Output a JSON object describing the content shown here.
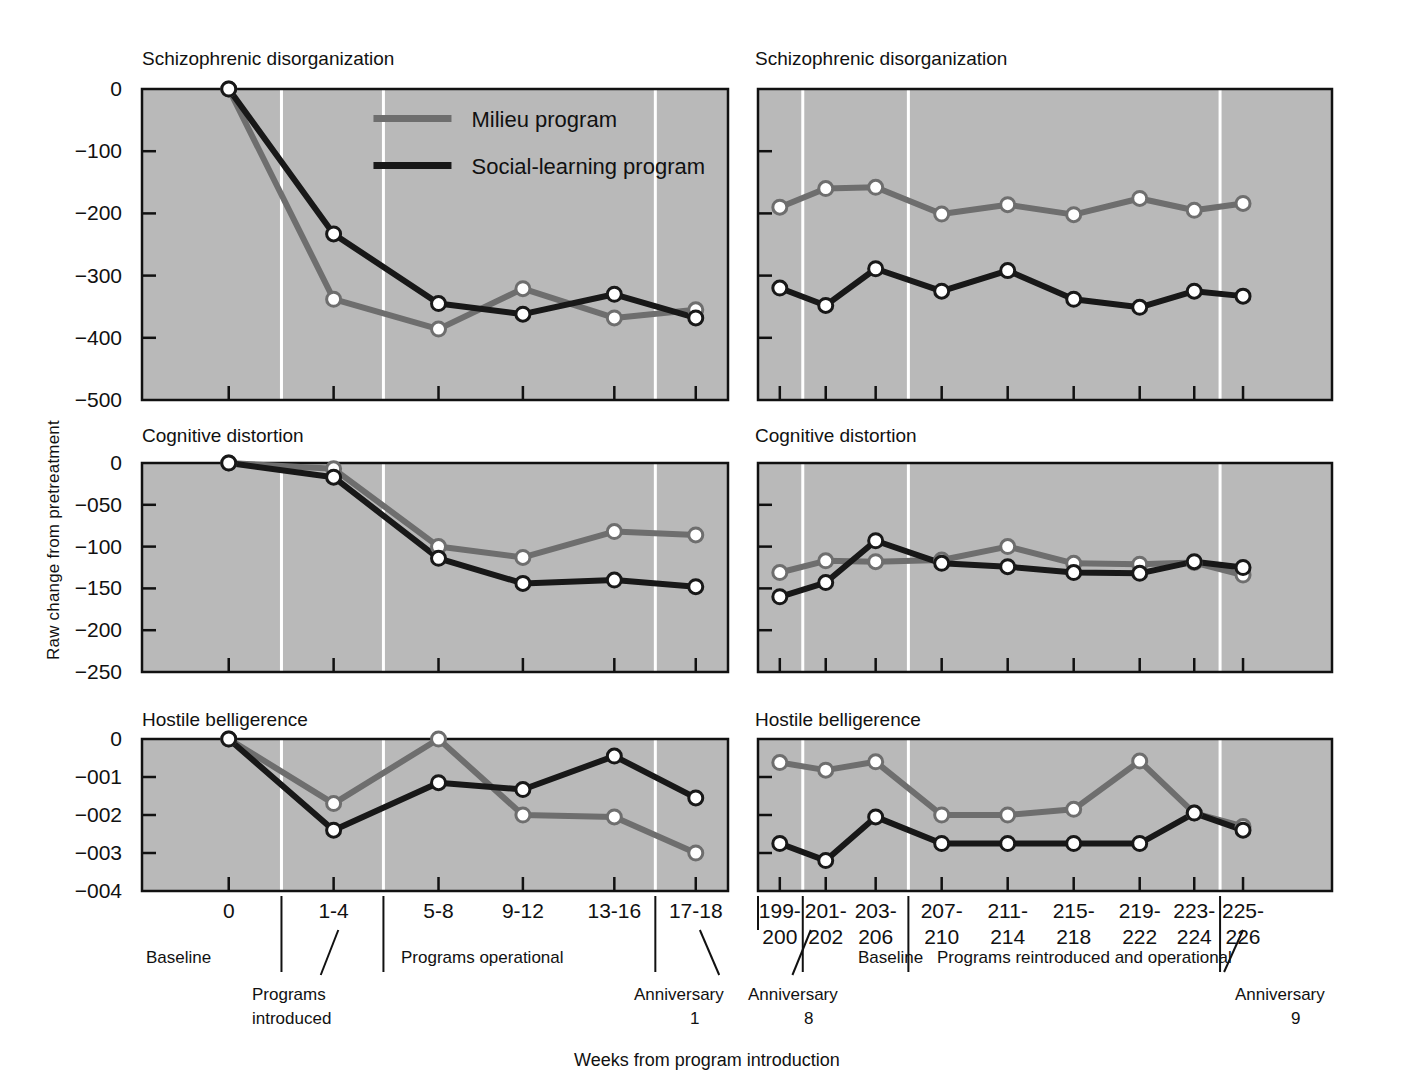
{
  "figure": {
    "ylabel": "Raw change from pretreatment",
    "xlabel": "Weeks from program introduction",
    "bg_plot": "#b9b9b9",
    "color_milieu": "#6e6e6e",
    "color_social": "#181818",
    "marker_fill": "#ffffff"
  },
  "legend": {
    "position": "top-left-panel",
    "entries": [
      {
        "label": "Milieu program",
        "color": "#6e6e6e"
      },
      {
        "label": "Social-learning program",
        "color": "#181818"
      }
    ]
  },
  "annotations": {
    "left": {
      "baseline": "Baseline",
      "programs_introduced_line1": "Programs",
      "programs_introduced_line2": "introduced",
      "programs_operational": "Programs operational",
      "anniversary_line1": "Anniversary",
      "anniversary_line2": "1"
    },
    "right": {
      "anniversary8_line1": "Anniversary",
      "anniversary8_line2": "8",
      "baseline": "Baseline",
      "reintroduced": "Programs reintroduced and operational",
      "anniversary9_line1": "Anniversary",
      "anniversary9_line2": "9"
    }
  },
  "chart_data": [
    {
      "id": "left-schizophrenic",
      "type": "line",
      "title": "Schizophrenic disorganization",
      "xlabel": "",
      "ylabel": "Raw change from pretreatment",
      "categories": [
        "0",
        "1-4",
        "5-8",
        "9-12",
        "13-16",
        "17-18"
      ],
      "yticks": [
        "0",
        "−100",
        "−200",
        "−300",
        "−400",
        "−500"
      ],
      "ytickvals": [
        0,
        -100,
        -200,
        -300,
        -400,
        -500
      ],
      "ylim": [
        -500,
        0
      ],
      "grid": false,
      "legend": "inside-top-right",
      "series": [
        {
          "name": "Milieu program",
          "color": "#6e6e6e",
          "values": [
            0,
            -338,
            -386,
            -321,
            -368,
            -355
          ]
        },
        {
          "name": "Social-learning program",
          "color": "#181818",
          "values": [
            0,
            -233,
            -345,
            -362,
            -330,
            -368
          ]
        }
      ]
    },
    {
      "id": "left-cognitive",
      "type": "line",
      "title": "Cognitive distortion",
      "xlabel": "",
      "ylabel": "Raw change from pretreatment",
      "categories": [
        "0",
        "1-4",
        "5-8",
        "9-12",
        "13-16",
        "17-18"
      ],
      "yticks": [
        "0",
        "−050",
        "−100",
        "−150",
        "−200",
        "−250"
      ],
      "ytickvals": [
        0,
        -50,
        -100,
        -150,
        -200,
        -250
      ],
      "ylim": [
        -250,
        0
      ],
      "grid": false,
      "series": [
        {
          "name": "Milieu program",
          "color": "#6e6e6e",
          "values": [
            0,
            -7,
            -100,
            -113,
            -82,
            -86
          ]
        },
        {
          "name": "Social-learning program",
          "color": "#181818",
          "values": [
            0,
            -17,
            -114,
            -144,
            -140,
            -148
          ]
        }
      ]
    },
    {
      "id": "left-hostile",
      "type": "line",
      "title": "Hostile belligerence",
      "xlabel": "",
      "ylabel": "Raw change from pretreatment",
      "categories": [
        "0",
        "1-4",
        "5-8",
        "9-12",
        "13-16",
        "17-18"
      ],
      "yticks": [
        "0",
        "−001",
        "−002",
        "−003",
        "−004"
      ],
      "ytickvals": [
        0,
        -1,
        -2,
        -3,
        -4
      ],
      "ylim": [
        -4,
        0
      ],
      "grid": false,
      "series": [
        {
          "name": "Milieu program",
          "color": "#6e6e6e",
          "values": [
            0,
            -1.7,
            0,
            -2.0,
            -2.05,
            -3.0
          ]
        },
        {
          "name": "Social-learning program",
          "color": "#181818",
          "values": [
            0,
            -2.4,
            -1.15,
            -1.33,
            -0.45,
            -1.55
          ]
        }
      ]
    },
    {
      "id": "right-schizophrenic",
      "type": "line",
      "title": "Schizophrenic disorganization",
      "xlabel": "",
      "ylabel": "",
      "categories": [
        "199-\n200",
        "201-\n202",
        "203-\n206",
        "207-\n210",
        "211-\n214",
        "215-\n218",
        "219-\n222",
        "223-\n224",
        "225-\n226"
      ],
      "yticks": [
        "",
        "",
        "",
        "",
        "",
        ""
      ],
      "ytickvals": [
        0,
        -100,
        -200,
        -300,
        -400,
        -500
      ],
      "ylim": [
        -500,
        0
      ],
      "grid": false,
      "series": [
        {
          "name": "Milieu program",
          "color": "#6e6e6e",
          "values": [
            -190,
            -160,
            -158,
            -201,
            -186,
            -202,
            -176,
            -195,
            -184
          ]
        },
        {
          "name": "Social-learning program",
          "color": "#181818",
          "values": [
            -320,
            -348,
            -289,
            -325,
            -292,
            -338,
            -351,
            -325,
            -333
          ]
        }
      ]
    },
    {
      "id": "right-cognitive",
      "type": "line",
      "title": "Cognitive distortion",
      "xlabel": "",
      "ylabel": "",
      "categories": [
        "199-\n200",
        "201-\n202",
        "203-\n206",
        "207-\n210",
        "211-\n214",
        "215-\n218",
        "219-\n222",
        "223-\n224",
        "225-\n226"
      ],
      "yticks": [
        "",
        "",
        "",
        "",
        "",
        ""
      ],
      "ytickvals": [
        0,
        -50,
        -100,
        -150,
        -200,
        -250
      ],
      "ylim": [
        -250,
        0
      ],
      "grid": false,
      "series": [
        {
          "name": "Milieu program",
          "color": "#6e6e6e",
          "values": [
            -131,
            -117,
            -118,
            -116,
            -100,
            -120,
            -121,
            -119,
            -134
          ]
        },
        {
          "name": "Social-learning program",
          "color": "#181818",
          "values": [
            -160,
            -143,
            -93,
            -120,
            -124,
            -131,
            -132,
            -118,
            -125
          ]
        }
      ]
    },
    {
      "id": "right-hostile",
      "type": "line",
      "title": "Hostile belligerence",
      "xlabel": "",
      "ylabel": "",
      "categories": [
        "199-\n200",
        "201-\n202",
        "203-\n206",
        "207-\n210",
        "211-\n214",
        "215-\n218",
        "219-\n222",
        "223-\n224",
        "225-\n226"
      ],
      "yticks": [
        "",
        "",
        "",
        "",
        ""
      ],
      "ytickvals": [
        0,
        -1,
        -2,
        -3,
        -4
      ],
      "ylim": [
        -4,
        0
      ],
      "grid": false,
      "series": [
        {
          "name": "Milieu program",
          "color": "#6e6e6e",
          "values": [
            -0.62,
            -0.82,
            -0.6,
            -2.0,
            -2.0,
            -1.85,
            -0.58,
            -1.95,
            -2.3
          ]
        },
        {
          "name": "Social-learning program",
          "color": "#181818",
          "values": [
            -2.75,
            -3.2,
            -2.05,
            -2.75,
            -2.75,
            -2.75,
            -2.75,
            -1.95,
            -2.4
          ]
        }
      ]
    }
  ]
}
